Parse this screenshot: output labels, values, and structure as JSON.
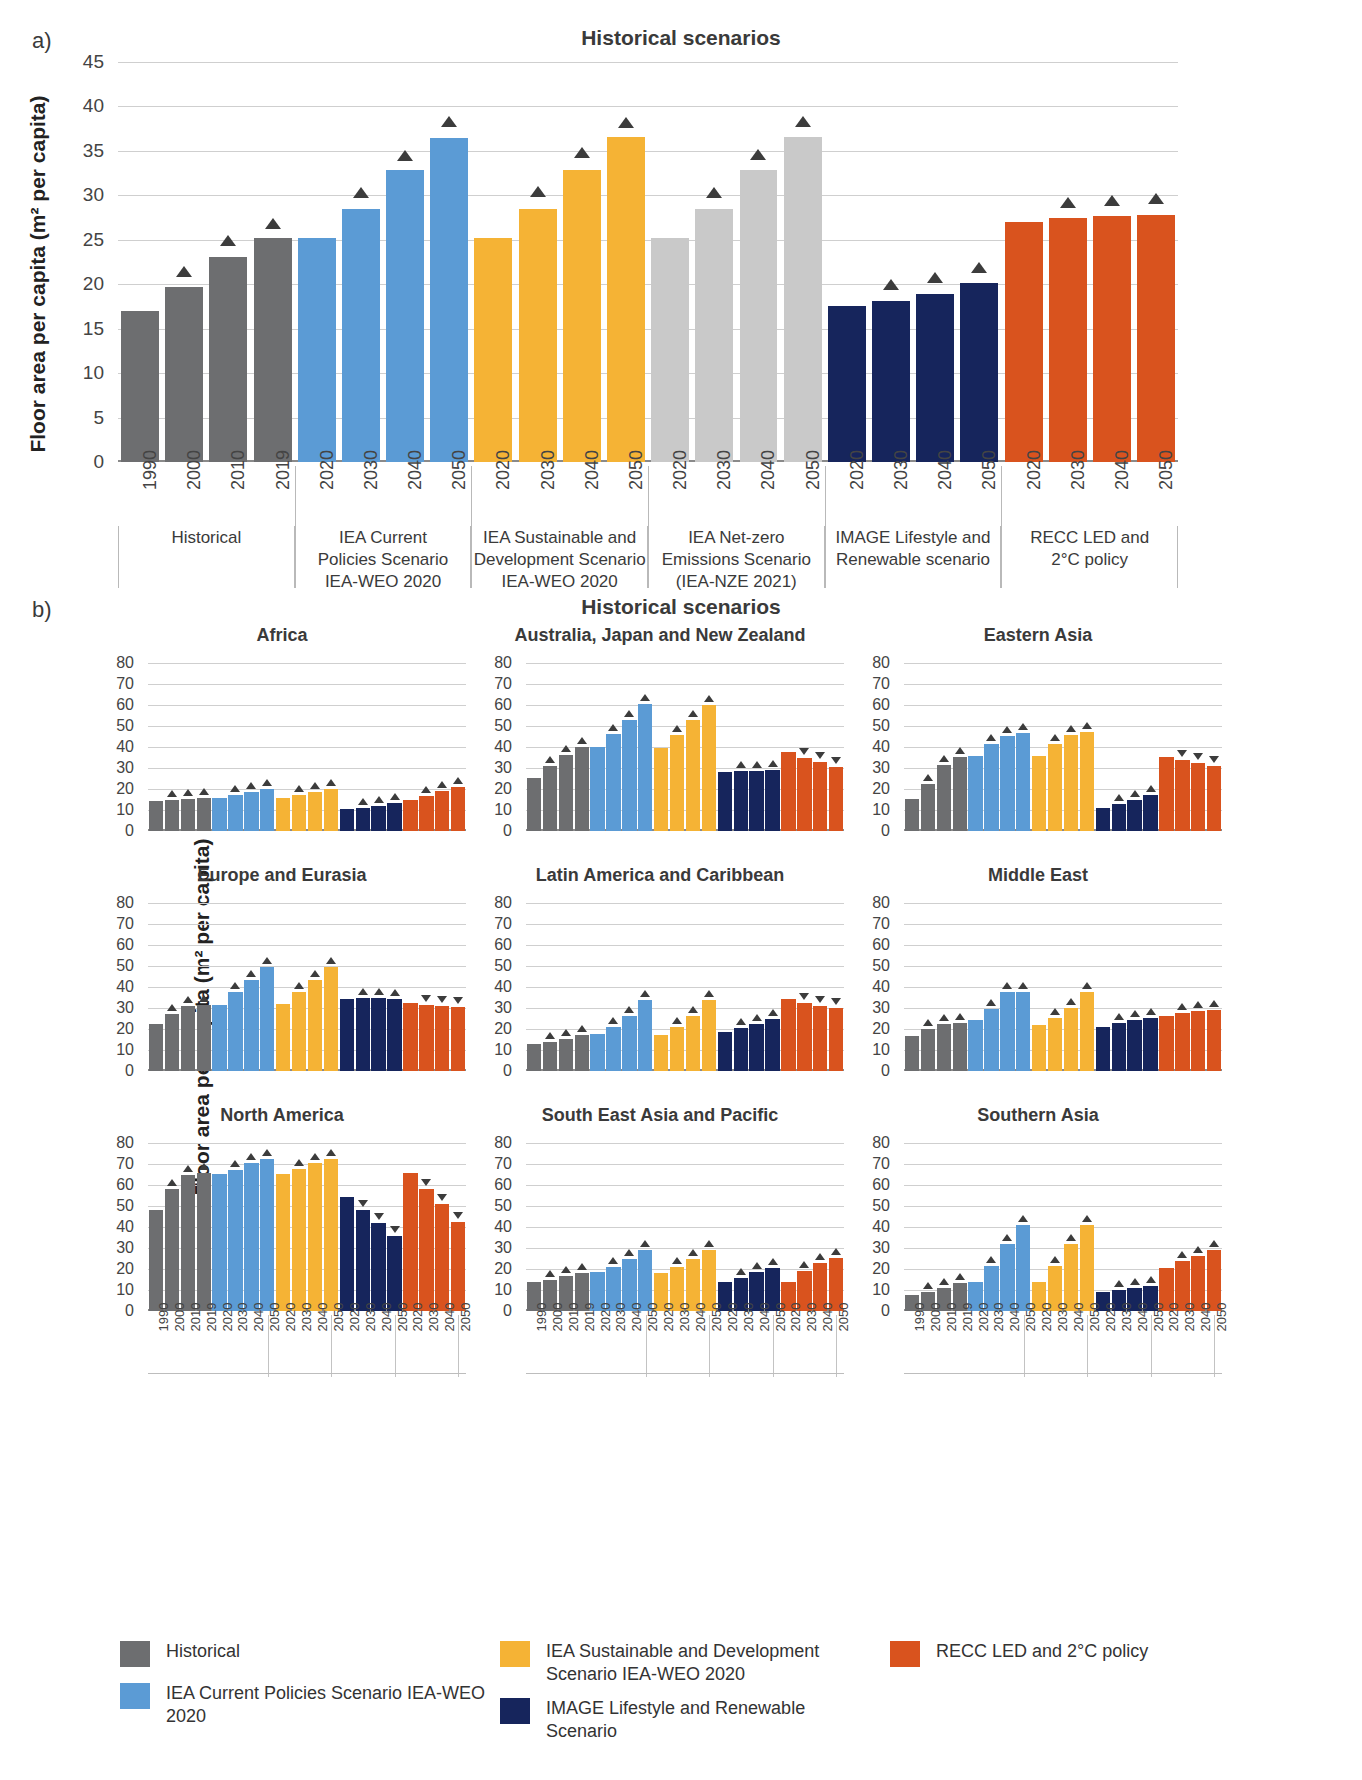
{
  "panel_a": {
    "letter": "a)",
    "title": "Historical scenarios",
    "ylabel": "Floor area per capita (m² per capita)",
    "yticks": [
      "45",
      "40",
      "35",
      "30",
      "25",
      "20",
      "15",
      "10",
      "5",
      "0"
    ],
    "groups": [
      {
        "label": "Historical",
        "color": "#6d6e70",
        "years": [
          "1990",
          "2000",
          "2010",
          "2019"
        ],
        "values": [
          17.0,
          19.7,
          23.1,
          25.2
        ],
        "markers": [
          null,
          "up",
          "up",
          "up"
        ],
        "marker_values": [
          null,
          20.8,
          24.3,
          26.2
        ]
      },
      {
        "label": "IEA Current\nPolicies Scenario\nIEA-WEO 2020",
        "color": "#5b9bd5",
        "years": [
          "2020",
          "2030",
          "2040",
          "2050"
        ],
        "values": [
          25.2,
          28.5,
          32.8,
          36.5
        ],
        "markers": [
          null,
          "up",
          "up",
          "up"
        ],
        "marker_values": [
          null,
          29.7,
          33.9,
          37.7
        ]
      },
      {
        "label": "IEA Sustainable and\nDevelopment Scenario\nIEA-WEO 2020",
        "color": "#f5b335",
        "years": [
          "2020",
          "2030",
          "2040",
          "2050"
        ],
        "values": [
          25.2,
          28.5,
          32.8,
          36.6
        ],
        "markers": [
          null,
          "up",
          "up",
          "up"
        ],
        "marker_values": [
          null,
          29.8,
          34.2,
          37.6
        ]
      },
      {
        "label": "IEA Net-zero\nEmissions Scenario\n(IEA-NZE 2021)",
        "color": "#c9c9c9",
        "years": [
          "2020",
          "2030",
          "2040",
          "2050"
        ],
        "values": [
          25.2,
          28.5,
          32.8,
          36.6
        ],
        "markers": [
          null,
          "up",
          "up",
          "up"
        ],
        "marker_values": [
          null,
          29.7,
          34.0,
          37.7
        ]
      },
      {
        "label": "IMAGE Lifestyle and\nRenewable scenario",
        "color": "#16255c",
        "years": [
          "2020",
          "2030",
          "2040",
          "2050"
        ],
        "values": [
          17.5,
          18.1,
          18.9,
          20.1
        ],
        "markers": [
          null,
          "up",
          "up",
          "up"
        ],
        "marker_values": [
          null,
          19.3,
          20.1,
          21.3
        ]
      },
      {
        "label": "RECC LED and\n2°C policy",
        "color": "#d9531e",
        "years": [
          "2020",
          "2030",
          "2040",
          "2050"
        ],
        "values": [
          27.0,
          27.4,
          27.7,
          27.8
        ],
        "markers": [
          null,
          "up",
          "up",
          "up"
        ],
        "marker_values": [
          null,
          28.6,
          28.8,
          29.0
        ]
      }
    ]
  },
  "panel_b": {
    "letter": "b)",
    "title": "Historical scenarios",
    "ylabel": "Floor area per capita (m² per capita)",
    "yticks": [
      "80",
      "70",
      "60",
      "50",
      "40",
      "30",
      "20",
      "10",
      "0"
    ],
    "years": [
      "1990",
      "2000",
      "2010",
      "2019",
      "2020",
      "2030",
      "2040",
      "2050",
      "2020",
      "2030",
      "2040",
      "2050",
      "2020",
      "2030",
      "2040",
      "2050",
      "2020",
      "2030",
      "2040",
      "2050"
    ],
    "group_colors": [
      "#6d6e70",
      "#5b9bd5",
      "#f5b335",
      "#16255c",
      "#d9531e"
    ],
    "subplots": [
      {
        "title": "Africa",
        "values": [
          14.5,
          15.0,
          15.5,
          16.0,
          16.0,
          17.0,
          18.4,
          20.0,
          16.0,
          17.3,
          18.6,
          20.1,
          10.5,
          11.0,
          12.0,
          13.3,
          14.8,
          16.8,
          19.0,
          21.0
        ],
        "markers": [
          null,
          "up",
          "up",
          "up",
          null,
          "up",
          "up",
          "up",
          null,
          "up",
          "up",
          "up",
          null,
          "up",
          "up",
          "up",
          null,
          "up",
          "up",
          "up"
        ]
      },
      {
        "title": "Australia, Japan and New Zealand",
        "values": [
          25.5,
          31.0,
          36.5,
          40.0,
          40.0,
          46.5,
          53.0,
          60.5,
          39.5,
          46.0,
          53.0,
          60.0,
          28.0,
          28.5,
          28.5,
          29.0,
          37.5,
          35.0,
          33.0,
          30.5
        ],
        "markers": [
          null,
          "up",
          "up",
          "up",
          null,
          "up",
          "up",
          "up",
          null,
          "up",
          "up",
          "up",
          null,
          "up",
          "up",
          "up",
          null,
          "down",
          "down",
          "down"
        ]
      },
      {
        "title": "Eastern Asia",
        "values": [
          15.5,
          22.5,
          31.5,
          35.5,
          36.0,
          41.5,
          45.5,
          47.0,
          36.0,
          41.5,
          46.0,
          47.5,
          11.0,
          13.0,
          15.0,
          17.0,
          35.5,
          34.0,
          32.5,
          31.0
        ],
        "markers": [
          null,
          "up",
          "up",
          "up",
          null,
          "up",
          "up",
          "up",
          null,
          "up",
          "up",
          "up",
          null,
          "up",
          "up",
          "up",
          null,
          "down",
          "down",
          "down"
        ]
      },
      {
        "title": "Europe and Eurasia",
        "values": [
          22.5,
          27.0,
          31.0,
          31.5,
          31.5,
          37.5,
          43.5,
          49.5,
          32.0,
          37.5,
          43.5,
          49.5,
          34.5,
          34.8,
          34.9,
          34.5,
          32.5,
          31.5,
          31.0,
          30.5
        ],
        "markers": [
          null,
          "up",
          "up",
          "up",
          null,
          "up",
          "up",
          "up",
          null,
          "up",
          "up",
          "up",
          null,
          "up",
          "up",
          "up",
          null,
          "down",
          "down",
          "down"
        ]
      },
      {
        "title": "Latin America and Caribbean",
        "values": [
          13.0,
          14.0,
          15.5,
          17.0,
          17.5,
          21.0,
          26.5,
          34.0,
          17.0,
          21.0,
          26.5,
          34.0,
          18.5,
          20.5,
          22.5,
          25.0,
          34.5,
          32.5,
          31.0,
          30.0
        ],
        "markers": [
          null,
          "up",
          "up",
          "up",
          null,
          "up",
          "up",
          "up",
          null,
          "up",
          "up",
          "up",
          null,
          "up",
          "up",
          "up",
          null,
          "down",
          "down",
          "down"
        ]
      },
      {
        "title": "Middle East",
        "values": [
          16.5,
          20.0,
          22.5,
          23.0,
          24.5,
          29.5,
          37.5,
          37.5,
          22.0,
          25.5,
          30.0,
          37.5,
          21.0,
          23.0,
          24.5,
          25.5,
          26.5,
          27.5,
          28.5,
          29.0
        ],
        "markers": [
          null,
          "up",
          "up",
          "up",
          null,
          "up",
          "up",
          "up",
          null,
          "up",
          "up",
          "up",
          null,
          "up",
          "up",
          "up",
          null,
          "up",
          "up",
          "up"
        ]
      },
      {
        "title": "North America",
        "values": [
          48.0,
          58.5,
          65.0,
          66.0,
          65.5,
          67.5,
          70.5,
          72.5,
          65.5,
          68.0,
          70.5,
          72.5,
          54.5,
          48.0,
          42.0,
          36.0,
          66.0,
          58.5,
          51.0,
          42.5
        ],
        "markers": [
          null,
          "up",
          "up",
          "up",
          null,
          "up",
          "up",
          "up",
          null,
          "up",
          "up",
          "up",
          null,
          "down",
          "down",
          "down",
          null,
          "down",
          "down",
          "down"
        ]
      },
      {
        "title": "South East Asia and Pacific",
        "values": [
          14.0,
          15.0,
          16.5,
          18.0,
          18.5,
          21.0,
          25.0,
          29.0,
          18.0,
          21.0,
          25.0,
          29.0,
          14.0,
          16.0,
          18.5,
          20.5,
          14.0,
          19.0,
          23.0,
          25.5
        ],
        "markers": [
          null,
          "up",
          "up",
          "up",
          null,
          "up",
          "up",
          "up",
          null,
          "up",
          "up",
          "up",
          null,
          "up",
          "up",
          "up",
          null,
          "up",
          "up",
          "up"
        ]
      },
      {
        "title": "Southern Asia",
        "values": [
          7.5,
          9.0,
          11.0,
          13.5,
          14.0,
          21.5,
          32.0,
          41.0,
          14.0,
          21.5,
          32.0,
          41.0,
          9.0,
          10.0,
          11.0,
          12.0,
          20.5,
          24.0,
          26.5,
          29.0
        ],
        "markers": [
          null,
          "up",
          "up",
          "up",
          null,
          "up",
          "up",
          "up",
          null,
          "up",
          "up",
          "up",
          null,
          "up",
          "up",
          "up",
          null,
          "up",
          "up",
          "up"
        ]
      }
    ]
  },
  "legend": {
    "columns": [
      [
        {
          "label": "Historical",
          "color": "#6d6e70"
        },
        {
          "label": "IEA Current Policies Scenario IEA-WEO 2020",
          "color": "#5b9bd5"
        }
      ],
      [
        {
          "label": "IEA Sustainable and Development Scenario IEA-WEO 2020",
          "color": "#f5b335"
        },
        {
          "label": "IMAGE Lifestyle and Renewable Scenario",
          "color": "#16255c"
        }
      ],
      [
        {
          "label": "RECC LED and 2°C policy",
          "color": "#d9531e"
        }
      ]
    ]
  }
}
